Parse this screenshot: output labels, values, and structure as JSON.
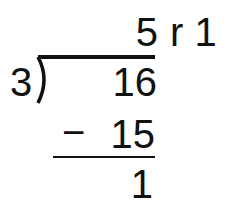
{
  "problem": {
    "type": "long-division",
    "divisor": "3",
    "dividend": "16",
    "quotient": "5",
    "remainder_label": "r 1",
    "subtrahend_sign": "−",
    "subtrahend": "15",
    "difference": "1"
  },
  "colors": {
    "ink": "#111111",
    "background": "#ffffff"
  }
}
